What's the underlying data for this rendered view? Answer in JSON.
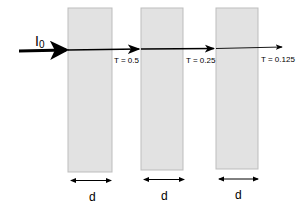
{
  "diagram": {
    "incident_label": "I",
    "incident_subscript": "0",
    "slabs": [
      {
        "x": 68,
        "y": 8,
        "w": 44,
        "h": 164,
        "transmission_label": "T = 0.5",
        "thickness_label": "d"
      },
      {
        "x": 141,
        "y": 8,
        "w": 42,
        "h": 162,
        "transmission_label": "T = 0.25",
        "thickness_label": "d"
      },
      {
        "x": 216,
        "y": 8,
        "w": 42,
        "h": 161,
        "transmission_label": "T = 0.125",
        "thickness_label": "d"
      }
    ],
    "colors": {
      "slab_fill": "#e2e2e2",
      "slab_stroke": "#bdbdbd",
      "line": "#000000"
    }
  }
}
